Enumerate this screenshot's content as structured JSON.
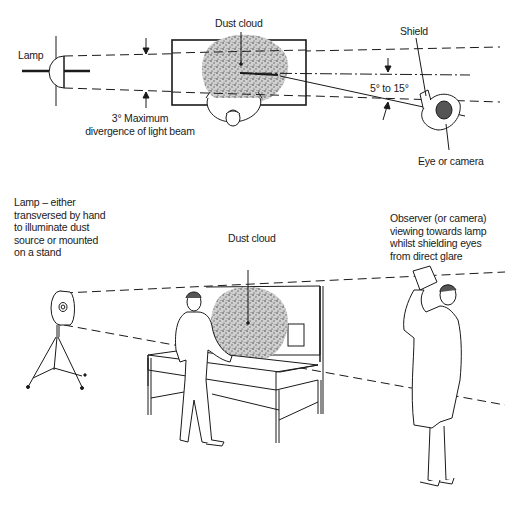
{
  "top_view": {
    "lamp_label": "Lamp",
    "dust_cloud_label": "Dust cloud",
    "shield_label": "Shield",
    "angle_label": "5° to 15°",
    "divergence_label_line1": "3° Maximum",
    "divergence_label_line2": "divergence of light beam",
    "eye_label": "Eye or camera"
  },
  "perspective_view": {
    "lamp_note": "Lamp – either\ntransversed by hand\nto illuminate dust\nsource or mounted\non a stand",
    "dust_cloud_label": "Dust cloud",
    "observer_note": "Observer (or camera)\nviewing towards lamp\nwhilst shielding eyes\nfrom direct glare"
  },
  "colors": {
    "ink": "#1a1a1a",
    "background": "#ffffff"
  }
}
